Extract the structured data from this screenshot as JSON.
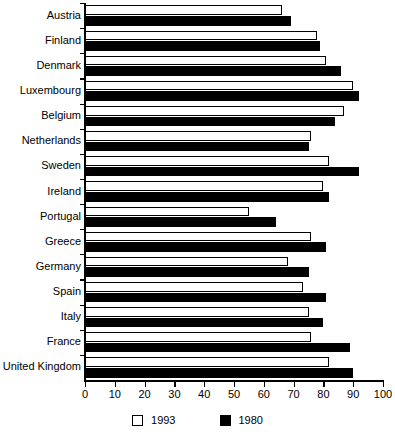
{
  "chart_data": {
    "type": "bar",
    "orientation": "horizontal",
    "title": "",
    "subtitle": "",
    "xlabel": "",
    "ylabel": "",
    "xlim": [
      0,
      100
    ],
    "grid": false,
    "legend_position": "bottom",
    "categories": [
      "Austria",
      "Finland",
      "Denmark",
      "Luxembourg",
      "Belgium",
      "Netherlands",
      "Sweden",
      "Ireland",
      "Portugal",
      "Greece",
      "Germany",
      "Spain",
      "Italy",
      "France",
      "United Kingdom"
    ],
    "series": [
      {
        "name": "1993",
        "color": "#ffffff",
        "values": [
          66,
          78,
          81,
          90,
          87,
          76,
          82,
          80,
          55,
          76,
          68,
          73,
          75,
          76,
          82
        ]
      },
      {
        "name": "1980",
        "color": "#000000",
        "values": [
          69,
          79,
          86,
          92,
          84,
          75,
          92,
          82,
          64,
          81,
          75,
          81,
          80,
          89,
          90
        ]
      }
    ],
    "xticks": [
      0,
      10,
      20,
      30,
      40,
      50,
      60,
      70,
      80,
      90,
      100
    ],
    "xtick_labels": [
      "0",
      "10",
      "20",
      "30",
      "40",
      "50",
      "60",
      "70",
      "80",
      "90",
      "100"
    ]
  },
  "legend": {
    "items": [
      {
        "label": "1993",
        "swatch": "white-square-swatch"
      },
      {
        "label": "1980",
        "swatch": "black-square-swatch"
      }
    ]
  }
}
